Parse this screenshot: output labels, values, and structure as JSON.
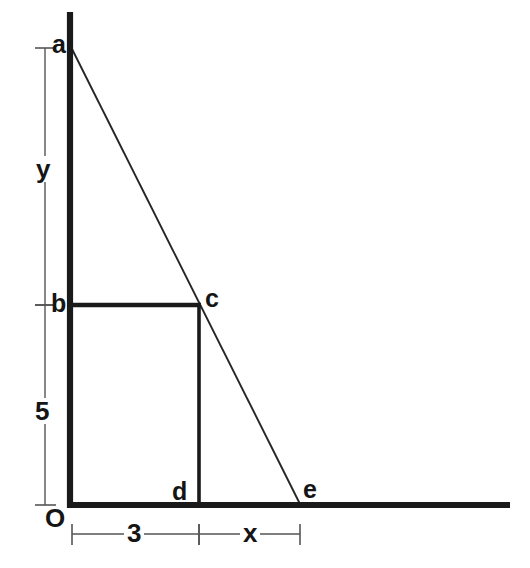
{
  "figure": {
    "background_color": "#ffffff",
    "stroke_color": "#1a1a1a",
    "dimension_line_color": "#555555",
    "axis_color": "#1a1a1a"
  },
  "points": {
    "a": {
      "label": "a",
      "x": 70,
      "y": 48
    },
    "b": {
      "label": "b",
      "x": 70,
      "y": 305
    },
    "c": {
      "label": "c",
      "x": 199,
      "y": 305
    },
    "d": {
      "label": "d",
      "x": 199,
      "y": 505
    },
    "e": {
      "label": "e",
      "x": 300,
      "y": 505
    },
    "O": {
      "label": "O",
      "x": 70,
      "y": 505
    }
  },
  "dimensions": {
    "vertical_upper": {
      "label": "y",
      "from": "a",
      "to": "b",
      "orientation": "vertical"
    },
    "vertical_lower": {
      "label": "5",
      "from": "b",
      "to": "O",
      "orientation": "vertical"
    },
    "horizontal_left": {
      "label": "3",
      "from": "O",
      "to": "d",
      "orientation": "horizontal"
    },
    "horizontal_right": {
      "label": "x",
      "from": "d",
      "to": "e",
      "orientation": "horizontal"
    }
  },
  "axes": {
    "vertical_axis": {
      "name": "vertical-axis",
      "x": 70,
      "y_top": 12,
      "y_bottom": 508
    },
    "horizontal_axis": {
      "name": "horizontal-axis",
      "y": 505,
      "x_left": 70,
      "x_right": 510
    }
  },
  "segments": {
    "hypotenuse": {
      "name": "line-a-to-e",
      "from": "a",
      "to": "e"
    },
    "rect_top": {
      "name": "line-b-to-c",
      "from": "b",
      "to": "c"
    },
    "rect_right": {
      "name": "line-c-to-d",
      "from": "c",
      "to": "d"
    }
  }
}
